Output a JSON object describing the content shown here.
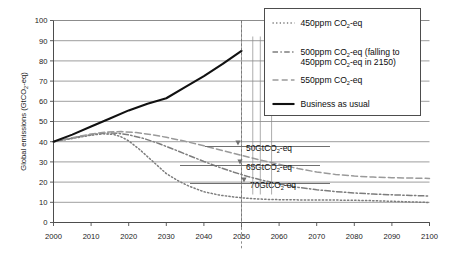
{
  "chart_data": {
    "type": "line",
    "title": "",
    "xlabel": "",
    "ylabel_parts": {
      "pre": "Global emissions (GtCO",
      "sub": "2",
      "post": "-eq)"
    },
    "ylabel": "Global emissions (GtCO2-eq)",
    "xlim": [
      2000,
      2100
    ],
    "ylim": [
      0,
      100
    ],
    "grid": "horizontal",
    "legend_position": "top-right",
    "xticks": [
      "2000",
      "2010",
      "2020",
      "2030",
      "2040",
      "2050",
      "2060",
      "2070",
      "2080",
      "2090",
      "2100"
    ],
    "yticks": [
      "0",
      "10",
      "20",
      "30",
      "40",
      "50",
      "60",
      "70",
      "80",
      "90",
      "100"
    ],
    "series": [
      {
        "name": "450ppm CO2-eq",
        "style": "dotted",
        "color": "#7d7d7d",
        "x": [
          2000,
          2005,
          2010,
          2013,
          2016,
          2018,
          2020,
          2023,
          2025,
          2028,
          2030,
          2033,
          2036,
          2040,
          2044,
          2048,
          2052,
          2056,
          2060,
          2065,
          2070,
          2075,
          2080,
          2085,
          2090,
          2095,
          2100
        ],
        "y": [
          40.0,
          41.6,
          43.2,
          43.9,
          43.6,
          42.4,
          40.4,
          36.0,
          32.6,
          27.6,
          24.2,
          20.8,
          18.0,
          15.2,
          13.6,
          12.6,
          11.9,
          11.5,
          11.3,
          11.2,
          11.2,
          11.1,
          11.0,
          10.8,
          10.5,
          10.2,
          9.9
        ]
      },
      {
        "name": "500ppm CO2-eq (falling to 450ppm CO2-eq in 2150)",
        "style": "dash-dot",
        "color": "#7d7d7d",
        "x": [
          2000,
          2005,
          2010,
          2014,
          2017,
          2020,
          2024,
          2028,
          2032,
          2036,
          2040,
          2044,
          2048,
          2052,
          2056,
          2060,
          2065,
          2070,
          2075,
          2080,
          2085,
          2090,
          2095,
          2100
        ],
        "y": [
          40.0,
          41.8,
          43.5,
          44.3,
          44.2,
          43.4,
          41.6,
          39.1,
          36.2,
          33.2,
          30.2,
          27.4,
          24.9,
          22.6,
          20.7,
          19.1,
          17.4,
          16.2,
          15.3,
          14.6,
          14.1,
          13.7,
          13.4,
          13.1
        ]
      },
      {
        "name": "550ppm CO2-eq",
        "style": "dashed",
        "color": "#9a9a9a",
        "x": [
          2000,
          2005,
          2010,
          2014,
          2018,
          2022,
          2026,
          2030,
          2035,
          2040,
          2045,
          2050,
          2055,
          2060,
          2065,
          2070,
          2075,
          2080,
          2085,
          2090,
          2095,
          2100
        ],
        "y": [
          40.0,
          42.0,
          43.8,
          44.8,
          45.0,
          44.5,
          43.5,
          42.2,
          40.2,
          38.0,
          35.6,
          33.2,
          30.9,
          28.8,
          26.7,
          25.0,
          23.8,
          23.0,
          22.5,
          22.2,
          22.0,
          21.8
        ]
      },
      {
        "name": "Business as usual",
        "style": "solid",
        "color": "#111111",
        "x": [
          2000,
          2005,
          2010,
          2015,
          2020,
          2025,
          2030,
          2035,
          2040,
          2045,
          2050
        ],
        "y": [
          40.0,
          43.5,
          47.5,
          51.5,
          55.5,
          58.8,
          61.5,
          67.0,
          72.5,
          78.5,
          85.0
        ]
      }
    ],
    "annotations": [
      {
        "label_pre": "50GtCO",
        "label_sub": "2",
        "label_post": "-eq",
        "value": 50,
        "year_marker": 2053
      },
      {
        "label_pre": "65GtCO",
        "label_sub": "2",
        "label_post": "-eq",
        "value": 65,
        "year_marker": 2055
      },
      {
        "label_pre": "70GtCO",
        "label_sub": "2",
        "label_post": "-eq",
        "value": 70,
        "year_marker": 2058
      }
    ],
    "vertical_markers": [
      2050,
      2053,
      2055,
      2058
    ]
  },
  "legend": {
    "items": [
      {
        "pre": "450ppm CO",
        "sub": "2",
        "post": "-eq",
        "line2_pre": "",
        "line2_sub": "",
        "line2_post": "",
        "style": "dotted"
      },
      {
        "pre": "500ppm CO",
        "sub": "2",
        "post": "-eq (falling to",
        "line2_pre": "450ppm CO",
        "line2_sub": "2",
        "line2_post": "-eq in 2150)",
        "style": "dash-dot"
      },
      {
        "pre": "550ppm CO",
        "sub": "2",
        "post": "-eq",
        "line2_pre": "",
        "line2_sub": "",
        "line2_post": "",
        "style": "dashed"
      },
      {
        "pre": "Business as usual",
        "sub": "",
        "post": "",
        "line2_pre": "",
        "line2_sub": "",
        "line2_post": "",
        "style": "solid"
      }
    ]
  },
  "colors": {
    "axis": "#4d4d4d",
    "grid": "#8c8c8c",
    "bau": "#111111",
    "s450": "#7d7d7d",
    "s500": "#7d7d7d",
    "s550": "#9a9a9a",
    "annotation": "#6f6f6f",
    "background": "#ffffff"
  }
}
